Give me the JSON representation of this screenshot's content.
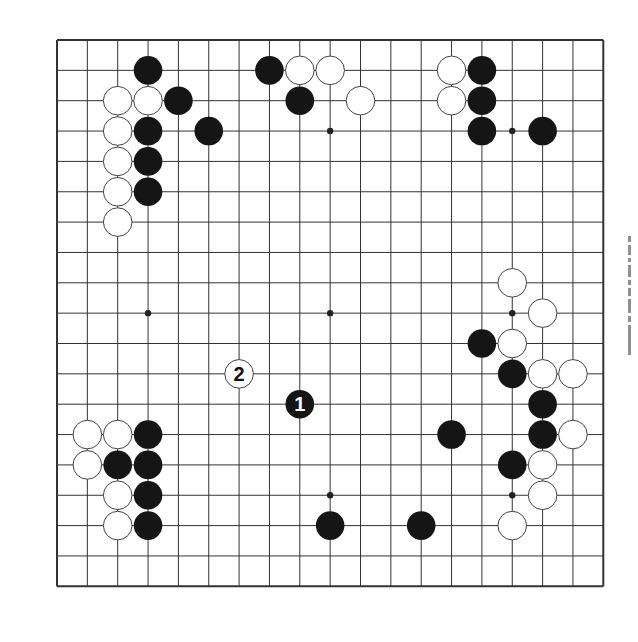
{
  "diagram": {
    "type": "go-board",
    "size": 19,
    "colors": {
      "background": "#ffffff",
      "line": "#333333",
      "black_stone": "#151515",
      "white_stone": "#ffffff",
      "white_stone_edge": "#444444"
    },
    "star_points": [
      [
        3,
        3
      ],
      [
        9,
        3
      ],
      [
        15,
        3
      ],
      [
        3,
        9
      ],
      [
        9,
        9
      ],
      [
        15,
        9
      ],
      [
        3,
        15
      ],
      [
        9,
        15
      ],
      [
        15,
        15
      ]
    ],
    "stones": [
      {
        "color": "black",
        "col": 3,
        "row": 1
      },
      {
        "color": "white",
        "col": 2,
        "row": 2
      },
      {
        "color": "white",
        "col": 3,
        "row": 2
      },
      {
        "color": "black",
        "col": 4,
        "row": 2
      },
      {
        "color": "white",
        "col": 2,
        "row": 3
      },
      {
        "color": "black",
        "col": 3,
        "row": 3
      },
      {
        "color": "black",
        "col": 5,
        "row": 3
      },
      {
        "color": "white",
        "col": 2,
        "row": 4
      },
      {
        "color": "black",
        "col": 3,
        "row": 4
      },
      {
        "color": "white",
        "col": 2,
        "row": 5
      },
      {
        "color": "black",
        "col": 3,
        "row": 5
      },
      {
        "color": "white",
        "col": 2,
        "row": 6
      },
      {
        "color": "black",
        "col": 7,
        "row": 1
      },
      {
        "color": "white",
        "col": 8,
        "row": 1
      },
      {
        "color": "white",
        "col": 9,
        "row": 1
      },
      {
        "color": "black",
        "col": 8,
        "row": 2
      },
      {
        "color": "white",
        "col": 10,
        "row": 2
      },
      {
        "color": "white",
        "col": 13,
        "row": 1
      },
      {
        "color": "black",
        "col": 14,
        "row": 1
      },
      {
        "color": "white",
        "col": 13,
        "row": 2
      },
      {
        "color": "black",
        "col": 14,
        "row": 2
      },
      {
        "color": "black",
        "col": 14,
        "row": 3
      },
      {
        "color": "black",
        "col": 16,
        "row": 3
      },
      {
        "color": "white",
        "col": 15,
        "row": 8
      },
      {
        "color": "white",
        "col": 16,
        "row": 9
      },
      {
        "color": "black",
        "col": 14,
        "row": 10
      },
      {
        "color": "white",
        "col": 15,
        "row": 10
      },
      {
        "color": "black",
        "col": 15,
        "row": 11
      },
      {
        "color": "white",
        "col": 16,
        "row": 11
      },
      {
        "color": "white",
        "col": 17,
        "row": 11
      },
      {
        "color": "black",
        "col": 16,
        "row": 12
      },
      {
        "color": "black",
        "col": 13,
        "row": 13
      },
      {
        "color": "black",
        "col": 16,
        "row": 13
      },
      {
        "color": "white",
        "col": 17,
        "row": 13
      },
      {
        "color": "black",
        "col": 15,
        "row": 14
      },
      {
        "color": "white",
        "col": 16,
        "row": 14
      },
      {
        "color": "white",
        "col": 16,
        "row": 15
      },
      {
        "color": "white",
        "col": 15,
        "row": 16
      },
      {
        "color": "black",
        "col": 12,
        "row": 16
      },
      {
        "color": "white",
        "col": 1,
        "row": 13
      },
      {
        "color": "white",
        "col": 2,
        "row": 13
      },
      {
        "color": "black",
        "col": 3,
        "row": 13
      },
      {
        "color": "white",
        "col": 1,
        "row": 14
      },
      {
        "color": "black",
        "col": 2,
        "row": 14
      },
      {
        "color": "black",
        "col": 3,
        "row": 14
      },
      {
        "color": "white",
        "col": 2,
        "row": 15
      },
      {
        "color": "black",
        "col": 3,
        "row": 15
      },
      {
        "color": "white",
        "col": 2,
        "row": 16
      },
      {
        "color": "black",
        "col": 3,
        "row": 16
      },
      {
        "color": "black",
        "col": 9,
        "row": 16
      },
      {
        "color": "black",
        "col": 8,
        "row": 12,
        "label": "1"
      },
      {
        "color": "white",
        "col": 6,
        "row": 11,
        "label": "2"
      }
    ]
  },
  "side_text": {
    "note": "faint vertical text cut off at right edge",
    "marks": 9
  }
}
